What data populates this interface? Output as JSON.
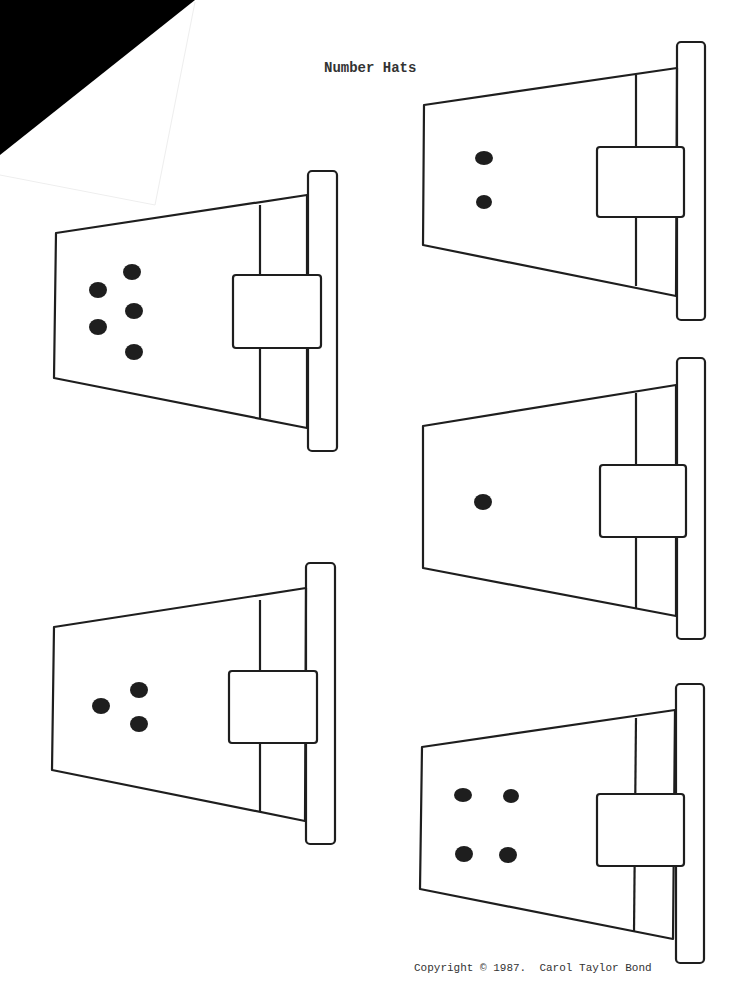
{
  "page": {
    "title": "Number Hats",
    "copyright": "Copyright © 1987.  Carol Taylor Bond"
  },
  "colors": {
    "ink": "#1e1e1e",
    "paper": "#ffffff",
    "corner": "#000000"
  },
  "hats": [
    {
      "id": "hat-five",
      "dots": 5,
      "position": "left-top"
    },
    {
      "id": "hat-two",
      "dots": 2,
      "position": "right-top"
    },
    {
      "id": "hat-one",
      "dots": 1,
      "position": "right-middle"
    },
    {
      "id": "hat-three",
      "dots": 3,
      "position": "left-bottom"
    },
    {
      "id": "hat-four",
      "dots": 4,
      "position": "right-bottom"
    }
  ]
}
